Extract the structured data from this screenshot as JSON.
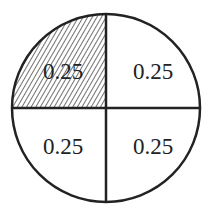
{
  "diagram": {
    "type": "circle divided into four equal quadrants",
    "shaded_quadrant": "top-left",
    "quadrants": [
      {
        "position": "top-left",
        "label": "0.25",
        "shaded": true
      },
      {
        "position": "top-right",
        "label": "0.25",
        "shaded": false
      },
      {
        "position": "bottom-left",
        "label": "0.25",
        "shaded": false
      },
      {
        "position": "bottom-right",
        "label": "0.25",
        "shaded": false
      }
    ],
    "colors": {
      "stroke": "#222222",
      "fill": "#ffffff",
      "hatch": "#333333"
    }
  }
}
